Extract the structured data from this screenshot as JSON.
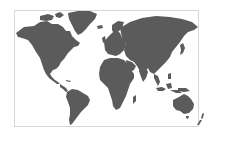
{
  "map": {
    "type": "world-map",
    "projection": "equirectangular-like",
    "colors": {
      "background": "#ffffff",
      "land": "#5b5b5b",
      "frame": "#d6d6d6"
    },
    "frame": {
      "x": 14.5,
      "y": 10.5,
      "width": 184,
      "height": 116
    },
    "regions": [
      {
        "name": "north-america",
        "d": "M16,33 L24,27 L34,26 L40,22 L47,21 L52,24 L58,24 L63,27 L66,31 L70,31 L72,36 L76,40 L80,43 L78,46 L74,47 L71,50 L68,53 L66,56 L64,59 L61,62 L59,66 L56,69 L53,70 L50,74 L52,77 L55,80 L58,82 L60,84 L57,84 L53,81 L49,78 L46,74 L44,70 L42,64 L40,58 L36,52 L32,45 L28,40 L22,38 L18,37 Z"
      },
      {
        "name": "hudson-bay-land",
        "d": "M56,30 L60,28 L64,30 L62,34 L58,34 Z"
      },
      {
        "name": "canadian-arctic",
        "d": "M40,16 L48,14 L54,16 L52,20 L46,21 L40,20 Z M55,14 L60,12 L64,15 L60,18 L56,17 Z"
      },
      {
        "name": "greenland",
        "d": "M68,13 L78,11 L90,11 L97,14 L95,19 L90,24 L86,29 L82,33 L78,35 L75,31 L72,25 L69,19 Z"
      },
      {
        "name": "iceland",
        "d": "M97,26 L102,25 L103,28 L98,29 Z"
      },
      {
        "name": "central-america",
        "d": "M60,84 L63,86 L66,88 L68,91 L66,92 L63,89 L60,87 Z"
      },
      {
        "name": "caribbean",
        "d": "M66,80 L71,81 L70,82 L66,81 Z"
      },
      {
        "name": "south-america",
        "d": "M67,92 L72,89 L78,90 L83,93 L88,96 L90,100 L88,105 L85,108 L81,112 L78,116 L75,120 L72,124 L70,125 L69,120 L70,114 L70,108 L68,102 L66,97 Z"
      },
      {
        "name": "europe",
        "d": "M104,42 L108,37 L112,33 L116,30 L120,33 L122,38 L125,40 L126,45 L124,50 L120,54 L116,56 L112,55 L108,54 L105,50 Z"
      },
      {
        "name": "scandinavia",
        "d": "M112,25 L118,21 L124,22 L122,28 L118,32 L114,34 L112,30 Z"
      },
      {
        "name": "british-isles",
        "d": "M102,38 L105,36 L106,41 L103,43 Z"
      },
      {
        "name": "asia",
        "d": "M120,28 L130,22 L142,18 L156,16 L170,17 L182,19 L192,22 L198,27 L194,30 L188,32 L184,36 L180,42 L176,47 L172,52 L170,57 L166,62 L162,66 L158,70 L154,74 L150,72 L148,68 L145,72 L142,76 L140,71 L137,66 L134,62 L130,60 L126,56 L124,50 L126,44 L122,38 Z"
      },
      {
        "name": "arabia",
        "d": "M126,60 L132,62 L136,66 L134,70 L130,72 L127,67 Z"
      },
      {
        "name": "india",
        "d": "M140,66 L146,68 L148,72 L146,78 L143,82 L141,77 L139,71 Z"
      },
      {
        "name": "japan",
        "d": "M180,45 L183,43 L185,48 L183,53 L180,55 L181,50 Z"
      },
      {
        "name": "africa",
        "d": "M104,60 L110,58 L118,58 L124,60 L128,64 L131,70 L134,74 L134,78 L130,84 L128,90 L126,96 L123,102 L120,108 L116,110 L113,106 L112,100 L110,94 L108,88 L104,84 L100,80 L99,74 L100,67 Z"
      },
      {
        "name": "madagascar",
        "d": "M133,97 L136,95 L136,101 L133,104 Z"
      },
      {
        "name": "southeast-asia",
        "d": "M154,74 L158,76 L160,82 L158,86 L156,82 L154,78 Z"
      },
      {
        "name": "indonesia",
        "d": "M156,88 L162,87 L166,89 L163,91 L158,91 Z M166,84 L171,83 L172,88 L168,89 Z M170,90 L178,90 L182,93 L176,93 Z"
      },
      {
        "name": "philippines",
        "d": "M168,74 L171,73 L171,79 L168,79 Z"
      },
      {
        "name": "new-guinea",
        "d": "M178,88 L186,88 L190,91 L184,92 L178,91 Z"
      },
      {
        "name": "australia",
        "d": "M173,100 L179,97 L184,94 L188,96 L191,99 L194,104 L193,109 L189,113 L184,114 L180,111 L176,110 L173,106 Z"
      },
      {
        "name": "tasmania",
        "d": "M186,116 L189,116 L188,119 L186,118 Z"
      },
      {
        "name": "new-zealand",
        "d": "M202,114 L204,113 L203,118 L201,119 Z M200,120 L202,120 L199,125 L197,125 Z"
      }
    ]
  }
}
